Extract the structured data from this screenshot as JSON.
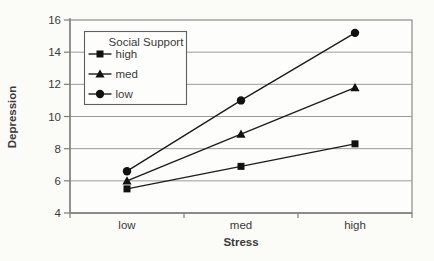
{
  "chart_data": {
    "type": "line",
    "title": "",
    "categories": [
      "low",
      "med",
      "high"
    ],
    "xlabel": "Stress",
    "ylabel": "Depression",
    "ylim": [
      4,
      16
    ],
    "yticks": [
      4,
      6,
      8,
      10,
      12,
      14,
      16
    ],
    "grid": "horizontal-only",
    "legend": {
      "title": "Social Support",
      "position": "inside-top-left"
    },
    "series": [
      {
        "name": "high",
        "marker": "square",
        "values": [
          5.5,
          6.9,
          8.3
        ]
      },
      {
        "name": "med",
        "marker": "triangle",
        "values": [
          6.0,
          8.9,
          11.8
        ]
      },
      {
        "name": "low",
        "marker": "circle",
        "values": [
          6.6,
          11.0,
          15.2
        ]
      }
    ],
    "colors": {
      "series_line": "#1c1c1c",
      "marker": "#111111",
      "gridline": "#9b9b9b",
      "plot_border": "#8a8a8a",
      "axis": "#7d7d7d",
      "text": "#3a3a3a",
      "legend_border": "#5f5f5f",
      "background": "#fbfbf8",
      "plot_background": "#fdfdfb"
    }
  }
}
